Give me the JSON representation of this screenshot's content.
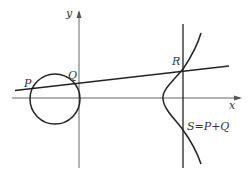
{
  "diagram": {
    "labels": {
      "y_axis": "y",
      "x_axis": "x",
      "P": "P",
      "Q": "Q",
      "R": "R",
      "S": "S=P+Q"
    },
    "colors": {
      "stroke": "#222222",
      "axis": "#555555",
      "text": "#333333",
      "background": "#ffffff"
    }
  }
}
